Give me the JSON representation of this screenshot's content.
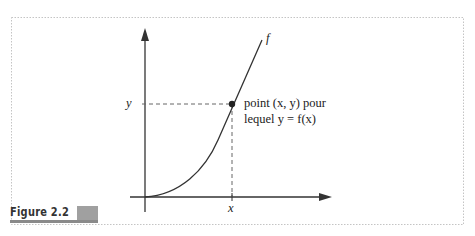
{
  "figure": {
    "label": "Figure 2.2",
    "curve_label": "f",
    "y_tick_label": "y",
    "x_tick_label": "x",
    "annotation_line1": "point (x, y) pour",
    "annotation_line2": "lequel y = f(x)"
  },
  "colors": {
    "frame_border": "#bdbdbd",
    "axes": "#333333",
    "curve": "#333333",
    "label_bar": "#a0a0a0"
  }
}
